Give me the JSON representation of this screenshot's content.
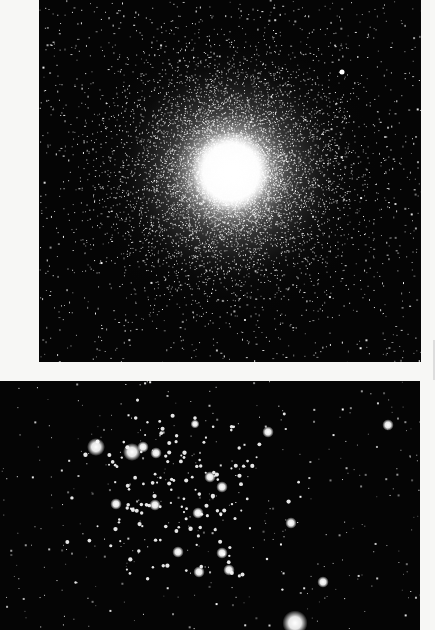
{
  "page": {
    "background": "#f7f7f5",
    "photos": [
      {
        "id": "top",
        "subject": "globular star cluster",
        "description": "Dense spherical cluster with bright saturated core, stars thinning outward; one bright field star upper right",
        "core_center": [
          231,
          172
        ],
        "core_radius": 30,
        "halo_radius": 150,
        "bright_star": [
          342,
          72
        ]
      },
      {
        "id": "bottom",
        "subject": "open star cluster",
        "description": "Loose scattered cluster of bright stars with diffraction glow; bright star lower right",
        "bright_stars": [
          [
            132,
            452
          ],
          [
            143,
            447
          ],
          [
            156,
            453
          ],
          [
            210,
            477
          ],
          [
            222,
            487
          ],
          [
            198,
            513
          ],
          [
            295,
            623
          ],
          [
            388,
            425
          ],
          [
            195,
            424
          ],
          [
            268,
            432
          ],
          [
            291,
            523
          ],
          [
            323,
            582
          ],
          [
            96,
            447
          ],
          [
            116,
            504
          ],
          [
            155,
            505
          ],
          [
            222,
            553
          ],
          [
            229,
            570
          ],
          [
            199,
            572
          ],
          [
            178,
            552
          ]
        ]
      }
    ]
  }
}
